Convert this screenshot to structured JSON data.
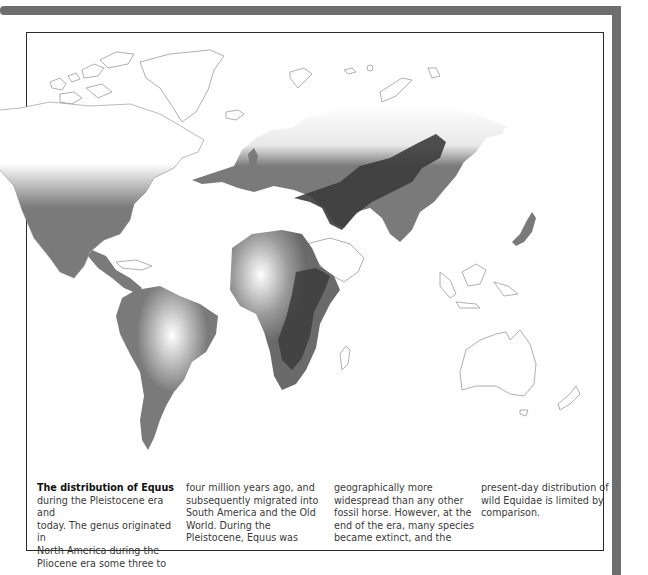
{
  "figure": {
    "title": "The distribution of Equus",
    "caption_columns": [
      {
        "lines": [
          "during the Pleistocene era and",
          "today. The genus originated in",
          "North America during the",
          "Pliocene era some three to"
        ]
      },
      {
        "lines": [
          "four million years ago, and",
          "subsequently migrated into",
          "South America and the Old",
          "World. During the",
          "Pleistocene, Equus was"
        ]
      },
      {
        "lines": [
          "geographically more",
          "widespread than any other",
          "fossil horse. However, at the",
          "end of the era, many species",
          "became extinct, and the"
        ]
      },
      {
        "lines": [
          "present-day distribution of",
          "wild Equidae is limited by",
          "comparison."
        ]
      }
    ]
  },
  "map": {
    "type": "world distribution map",
    "shading": {
      "pleistocene_range": "#7a7a7a",
      "present_day_range": "#3c3c3c",
      "outside_range": "#ffffff",
      "coastline": "#9a9a9a"
    },
    "regions_shaded": [
      "North America",
      "Central America",
      "South America",
      "Europe",
      "Africa",
      "Asia"
    ],
    "regions_dark": [
      "Central Asia",
      "Mongolia",
      "East Africa",
      "Southern Africa"
    ],
    "regions_unshaded": [
      "Arctic islands",
      "Greenland",
      "Arabia",
      "Southeast Asia",
      "Australia",
      "New Zealand"
    ]
  },
  "frame": {
    "band_color": "#6e6e6e",
    "border_color": "#2a2a2a"
  }
}
